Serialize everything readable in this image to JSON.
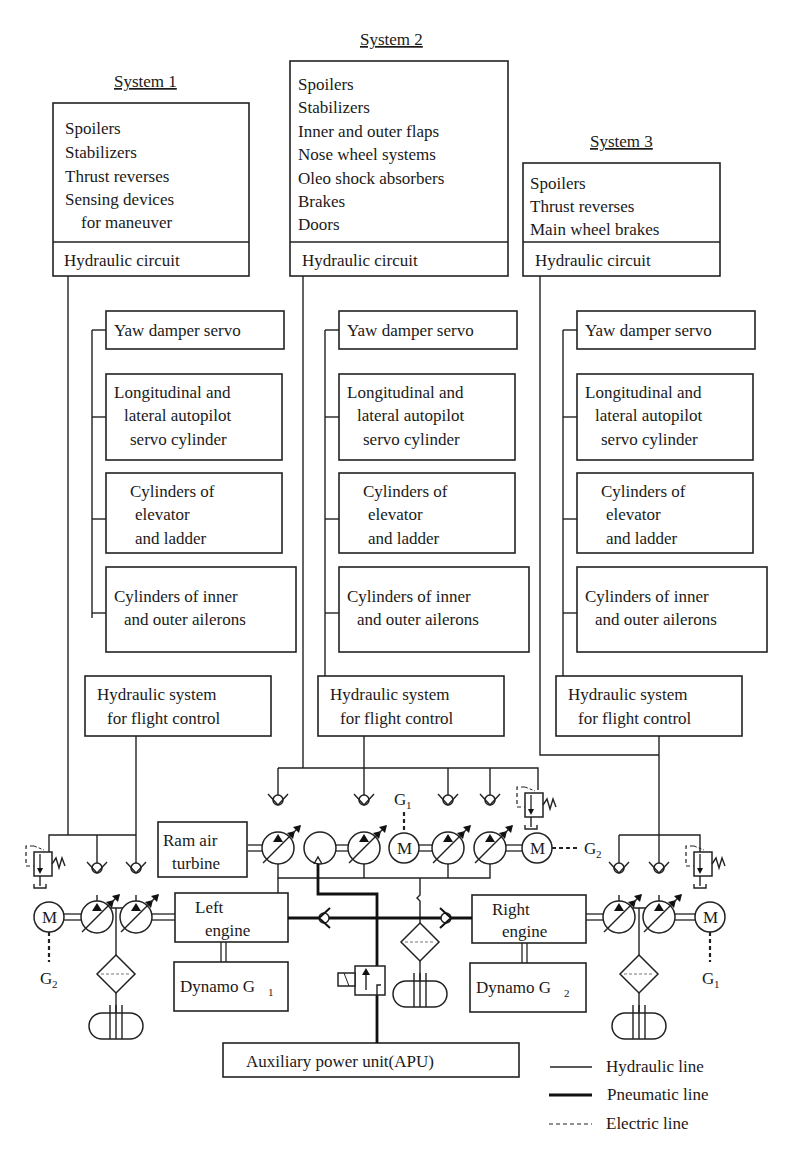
{
  "systems": [
    {
      "title": "System 1",
      "consumers": [
        "Spoilers",
        "Stabilizers",
        "Thrust reverses",
        "Sensing devices",
        "for maneuver"
      ],
      "circuit_label": "Hydraulic circuit"
    },
    {
      "title": "System 2",
      "consumers": [
        "Spoilers",
        "Stabilizers",
        "Inner and outer flaps",
        "Nose wheel systems",
        "Oleo shock absorbers",
        "Brakes",
        "Doors"
      ],
      "circuit_label": "Hydraulic circuit"
    },
    {
      "title": "System 3",
      "consumers": [
        "Spoilers",
        "Thrust reverses",
        "Main wheel brakes"
      ],
      "circuit_label": "Hydraulic circuit"
    }
  ],
  "flight_control": {
    "yaw": "Yaw damper servo",
    "autopilot": [
      "Longitudinal and",
      "lateral autopilot",
      "servo cylinder"
    ],
    "elevator": [
      "Cylinders of",
      "elevator",
      "and ladder"
    ],
    "ailerons": [
      "Cylinders of inner",
      "and outer ailerons"
    ],
    "hyd_system": [
      "Hydraulic system",
      "for flight control"
    ]
  },
  "power": {
    "ram_air": [
      "Ram air",
      "turbine"
    ],
    "left_engine": [
      "Left",
      "engine"
    ],
    "right_engine": [
      "Right",
      "engine"
    ],
    "dynamo1": "Dynamo G",
    "dynamo1_sub": "1",
    "dynamo2": "Dynamo G",
    "dynamo2_sub": "2",
    "apu": "Auxiliary power unit(APU)",
    "motor_label": "M",
    "g": "G",
    "g1_sub": "1",
    "g2_sub": "2"
  },
  "legend": [
    {
      "label": "Hydraulic line",
      "style": "thin"
    },
    {
      "label": "Pneumatic line",
      "style": "thick"
    },
    {
      "label": "Electric line",
      "style": "dashed"
    }
  ],
  "colors": {
    "ink": "#222222",
    "background": "#ffffff"
  }
}
